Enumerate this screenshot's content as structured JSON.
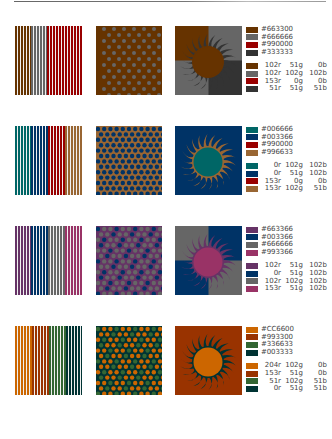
{
  "rows": [
    {
      "stripes": [
        "#663300",
        "#666666",
        "#990000",
        "#333333"
      ],
      "stripe_widths": [
        16,
        16,
        35,
        0
      ],
      "dots": {
        "bg": "#663300",
        "dot": "#666666",
        "layout": "square"
      },
      "sun": {
        "quad_tl": "#663300",
        "quad_tr": "#666666",
        "quad_bl": "#666666",
        "quad_br": "#333333",
        "rays": "#333333",
        "disc": "#663300",
        "edge": "#663300"
      },
      "hex": [
        "#663300",
        "#666666",
        "#990000",
        "#333333"
      ],
      "rgb": [
        {
          "color": "#663300",
          "r": "102r",
          "g": "51g",
          "b": "0b"
        },
        {
          "color": "#666666",
          "r": "102r",
          "g": "102g",
          "b": "102b"
        },
        {
          "color": "#990000",
          "r": "153r",
          "g": "0g",
          "b": "0b"
        },
        {
          "color": "#333333",
          "r": "51r",
          "g": "51g",
          "b": "51b"
        }
      ]
    },
    {
      "stripes": [
        "#006666",
        "#003366",
        "#990000",
        "#996633"
      ],
      "stripe_widths": [
        16,
        17,
        17,
        17
      ],
      "dots": {
        "bg": "#996633",
        "dot": "#003366",
        "layout": "hex"
      },
      "sun": {
        "quad_tl": "#003366",
        "quad_tr": "#003366",
        "quad_bl": "#003366",
        "quad_br": "#003366",
        "rays": "#996633",
        "disc": "#006666",
        "edge": "#996633"
      },
      "hex": [
        "#006666",
        "#003366",
        "#990000",
        "#996633"
      ],
      "rgb": [
        {
          "color": "#006666",
          "r": "0r",
          "g": "102g",
          "b": "102b"
        },
        {
          "color": "#003366",
          "r": "0r",
          "g": "51g",
          "b": "102b"
        },
        {
          "color": "#990000",
          "r": "153r",
          "g": "0g",
          "b": "0b"
        },
        {
          "color": "#996633",
          "r": "153r",
          "g": "102g",
          "b": "51b"
        }
      ]
    },
    {
      "stripes": [
        "#663366",
        "#003366",
        "#666666",
        "#993366"
      ],
      "stripe_widths": [
        16,
        17,
        17,
        17
      ],
      "dots": {
        "bg": "#663366",
        "dot": "#666666",
        "dot2": "#003366",
        "layout": "hex"
      },
      "sun": {
        "quad_tl": "#666666",
        "quad_tr": "#003366",
        "quad_bl": "#003366",
        "quad_br": "#666666",
        "rays": "#663366",
        "disc": "#993366",
        "edge": "#663366"
      },
      "hex": [
        "#663366",
        "#003366",
        "#666666",
        "#993366"
      ],
      "rgb": [
        {
          "color": "#663366",
          "r": "102r",
          "g": "51g",
          "b": "102b"
        },
        {
          "color": "#003366",
          "r": "0r",
          "g": "51g",
          "b": "102b"
        },
        {
          "color": "#666666",
          "r": "102r",
          "g": "102g",
          "b": "102b"
        },
        {
          "color": "#993366",
          "r": "153r",
          "g": "51g",
          "b": "102b"
        }
      ]
    },
    {
      "stripes": [
        "#CC6600",
        "#993300",
        "#336633",
        "#003333"
      ],
      "stripe_widths": [
        17,
        17,
        17,
        16
      ],
      "dots": {
        "bg": "#003333",
        "dot": "#CC6600",
        "dot2": "#336633",
        "layout": "hex"
      },
      "sun": {
        "quad_tl": "#993300",
        "quad_tr": "#993300",
        "quad_bl": "#993300",
        "quad_br": "#993300",
        "rays": "#003333",
        "disc": "#CC6600",
        "edge": "#003333"
      },
      "hex": [
        "#CC6600",
        "#993300",
        "#336633",
        "#003333"
      ],
      "rgb": [
        {
          "color": "#CC6600",
          "r": "204r",
          "g": "102g",
          "b": "0b"
        },
        {
          "color": "#993300",
          "r": "153r",
          "g": "51g",
          "b": "0b"
        },
        {
          "color": "#336633",
          "r": "51r",
          "g": "102g",
          "b": "51b"
        },
        {
          "color": "#003333",
          "r": "0r",
          "g": "51g",
          "b": "51b"
        }
      ]
    }
  ]
}
